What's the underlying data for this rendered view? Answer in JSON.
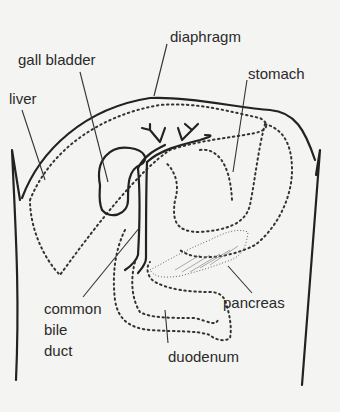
{
  "diagram": {
    "type": "anatomical illustration",
    "labels": {
      "diaphragm": "diaphragm",
      "gall_bladder": "gall bladder",
      "liver": "liver",
      "stomach": "stomach",
      "common_bile_duct_line1": "common",
      "common_bile_duct_line2": "bile",
      "common_bile_duct_line3": "duct",
      "pancreas": "pancreas",
      "duodenum": "duodenum"
    },
    "colors": {
      "ink": "#222222",
      "paper": "#f4f4f2"
    }
  }
}
